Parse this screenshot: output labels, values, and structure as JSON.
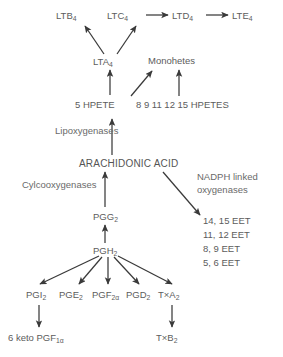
{
  "diagram": {
    "colors": {
      "background": "#ffffff",
      "text": "#5c5c5c",
      "arrow": "#3a3a3a"
    },
    "nodes": {
      "ltb4": {
        "base": "LTB",
        "sub": "4"
      },
      "ltc4": {
        "base": "LTC",
        "sub": "4"
      },
      "ltd4": {
        "base": "LTD",
        "sub": "4"
      },
      "lte4": {
        "base": "LTE",
        "sub": "4"
      },
      "lta4": {
        "base": "LTA",
        "sub": "4"
      },
      "monohetes": {
        "base": "Monohetes",
        "sub": ""
      },
      "hpete5": {
        "base": "5 HPETE",
        "sub": ""
      },
      "hpetes_list": {
        "base": "8  9  11  12  15   HPETES",
        "sub": ""
      },
      "lipoxygenases": {
        "base": "Lipoxygenases",
        "sub": ""
      },
      "arachidonic_acid": {
        "base": "ARACHIDONIC ACID",
        "sub": ""
      },
      "cyclooxygenases": {
        "base": "Cylcooxygenases",
        "sub": ""
      },
      "nadph_line1": {
        "base": "NADPH linked",
        "sub": ""
      },
      "nadph_line2": {
        "base": "oxygenases",
        "sub": ""
      },
      "pgg2": {
        "base": "PGG",
        "sub": "2"
      },
      "pgh2": {
        "base": "PGH",
        "sub": "2"
      },
      "pgi2": {
        "base": "PGI",
        "sub": "2"
      },
      "pge2": {
        "base": "PGE",
        "sub": "2"
      },
      "pgf2a": {
        "base": "PGF",
        "sub": "2α"
      },
      "pgd2": {
        "base": "PGD",
        "sub": "2"
      },
      "txa2": {
        "base": "T×A",
        "sub": "2"
      },
      "keto_pgf1a": {
        "base": "6 keto PGF",
        "sub": "1α"
      },
      "txb2": {
        "base": "T×B",
        "sub": "2"
      },
      "eet_14_15": {
        "base": "14, 15 EET",
        "sub": ""
      },
      "eet_11_12": {
        "base": "11, 12 EET",
        "sub": ""
      },
      "eet_8_9": {
        "base": "8, 9 EET",
        "sub": ""
      },
      "eet_5_6": {
        "base": "5, 6 EET",
        "sub": ""
      }
    }
  }
}
